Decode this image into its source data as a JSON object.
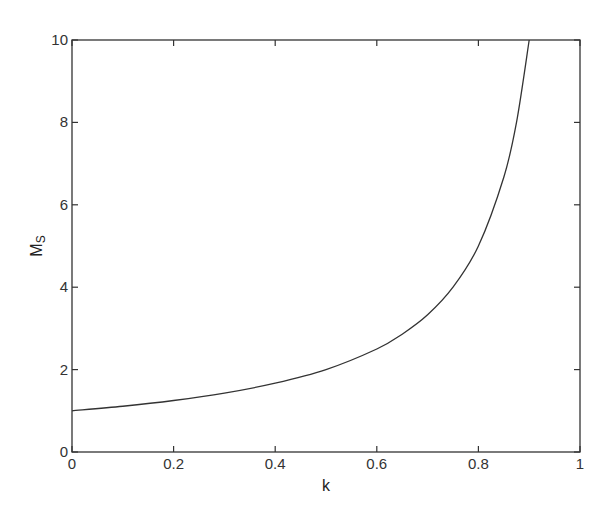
{
  "chart_data": {
    "type": "line",
    "title": "",
    "xlabel": "k",
    "ylabel": "M",
    "ylabel_subscript": "S",
    "xlim": [
      0,
      1
    ],
    "ylim": [
      0,
      10
    ],
    "grid": false,
    "legend": null,
    "xticks": [
      "0",
      "0.2",
      "0.4",
      "0.6",
      "0.8",
      "1"
    ],
    "yticks": [
      "0",
      "2",
      "4",
      "6",
      "8",
      "10"
    ],
    "series": [
      {
        "name": "M_S",
        "color": "#333333",
        "x": [
          0,
          0.1,
          0.2,
          0.3,
          0.4,
          0.5,
          0.6,
          0.65,
          0.7,
          0.75,
          0.8,
          0.85,
          0.875,
          0.9
        ],
        "y": [
          1.0,
          1.11,
          1.25,
          1.43,
          1.67,
          2.0,
          2.5,
          2.86,
          3.33,
          4.0,
          5.0,
          6.67,
          8.0,
          10.0
        ]
      }
    ]
  }
}
